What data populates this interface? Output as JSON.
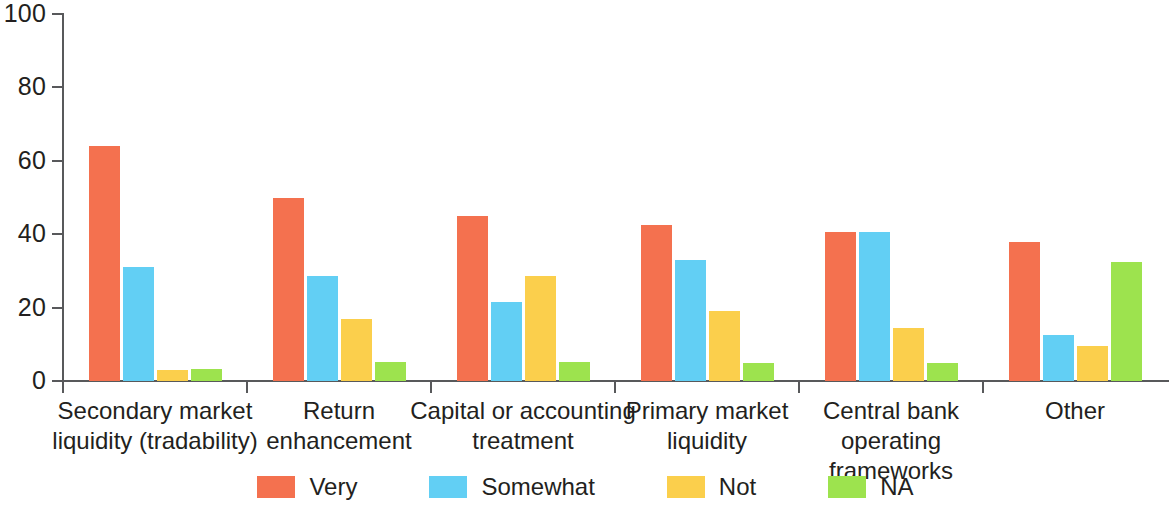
{
  "chart_data": {
    "type": "bar",
    "title": "",
    "subtitle": "",
    "xlabel": "",
    "ylabel": "",
    "ylim": [
      0,
      100
    ],
    "yticks": [
      0,
      20,
      40,
      60,
      80,
      100
    ],
    "grid": false,
    "legend_position": "bottom",
    "categories": [
      "Secondary market\nliquidity (tradability)",
      "Return\nenhancement",
      "Capital or accounting\ntreatment",
      "Primary market\nliquidity",
      "Central bank\noperating frameworks",
      "Other"
    ],
    "series": [
      {
        "name": "Very",
        "color": "#F4714F",
        "values": [
          64.0,
          50.0,
          45.0,
          42.5,
          40.5,
          38.0
        ]
      },
      {
        "name": "Somewhat",
        "color": "#62CFF4",
        "values": [
          31.0,
          28.5,
          21.5,
          33.0,
          40.5,
          12.5
        ]
      },
      {
        "name": "Not",
        "color": "#FBCF4C",
        "values": [
          3.0,
          17.0,
          28.5,
          19.0,
          14.5,
          9.5
        ]
      },
      {
        "name": "NA",
        "color": "#9DE34E",
        "values": [
          3.2,
          5.2,
          5.2,
          5.0,
          4.8,
          32.5
        ]
      }
    ]
  },
  "axis": {
    "y_tick_labels": [
      "0",
      "20",
      "40",
      "60",
      "80",
      "100"
    ]
  },
  "legend": {
    "items": [
      {
        "label": "Very",
        "color": "#F4714F"
      },
      {
        "label": "Somewhat",
        "color": "#62CFF4"
      },
      {
        "label": "Not",
        "color": "#FBCF4C"
      },
      {
        "label": "NA",
        "color": "#9DE34E"
      }
    ]
  }
}
